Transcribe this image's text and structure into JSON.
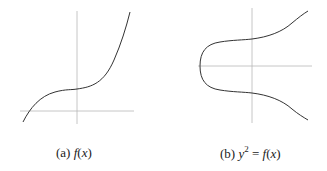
{
  "figures": [
    {
      "id": "a",
      "label": "(a)",
      "caption_prefix": "f",
      "caption_paren_open": "(",
      "caption_var": "x",
      "caption_paren_close": ")",
      "description": "Graph of cubic f(x) with one real root"
    },
    {
      "id": "b",
      "label": "(b)",
      "caption_y": "y",
      "caption_exp": "2",
      "caption_eq": "=",
      "caption_prefix": "f",
      "caption_paren_open": "(",
      "caption_var": "x",
      "caption_paren_close": ")",
      "description": "Elliptic curve y^2 = f(x), one connected component"
    }
  ],
  "colors": {
    "axis": "#b8b8b8",
    "curve": "#333333",
    "text": "#222222"
  }
}
